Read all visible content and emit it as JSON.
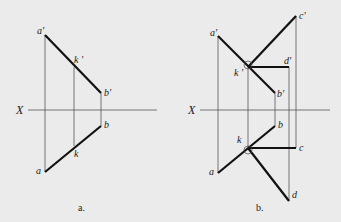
{
  "figures": [
    {
      "id": "a",
      "caption": "a.",
      "axis_label": "X",
      "points": {
        "a_prime": "a'",
        "k_prime": "k '",
        "b_prime": "b'",
        "b": "b",
        "k": "k",
        "a": "a"
      }
    },
    {
      "id": "b",
      "caption": "b.",
      "axis_label": "X",
      "points": {
        "a_prime": "a'",
        "k_prime": "k '",
        "b_prime": "b'",
        "c_prime": "c'",
        "d_prime": "d'",
        "b": "b",
        "k": "k",
        "a": "a",
        "c": "c",
        "d": "d"
      }
    }
  ]
}
